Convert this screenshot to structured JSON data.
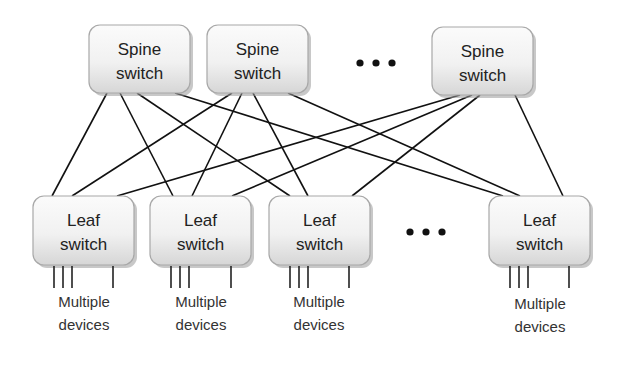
{
  "spines": [
    {
      "id": "spine-1",
      "line1": "Spine",
      "line2": "switch"
    },
    {
      "id": "spine-2",
      "line1": "Spine",
      "line2": "switch"
    },
    {
      "id": "spine-3",
      "line1": "Spine",
      "line2": "switch"
    }
  ],
  "leaves": [
    {
      "id": "leaf-1",
      "line1": "Leaf",
      "line2": "switch",
      "devices_line1": "Multiple",
      "devices_line2": "devices"
    },
    {
      "id": "leaf-2",
      "line1": "Leaf",
      "line2": "switch",
      "devices_line1": "Multiple",
      "devices_line2": "devices"
    },
    {
      "id": "leaf-3",
      "line1": "Leaf",
      "line2": "switch",
      "devices_line1": "Multiple",
      "devices_line2": "devices"
    },
    {
      "id": "leaf-4",
      "line1": "Leaf",
      "line2": "switch",
      "devices_line1": "Multiple",
      "devices_line2": "devices"
    }
  ],
  "ellipsis": {
    "spine_row": "more spine switches",
    "leaf_row": "more leaf switches"
  },
  "connections": [
    [
      "spine-1",
      "leaf-1"
    ],
    [
      "spine-1",
      "leaf-2"
    ],
    [
      "spine-1",
      "leaf-3"
    ],
    [
      "spine-1",
      "leaf-4"
    ],
    [
      "spine-2",
      "leaf-1"
    ],
    [
      "spine-2",
      "leaf-2"
    ],
    [
      "spine-2",
      "leaf-3"
    ],
    [
      "spine-2",
      "leaf-4"
    ],
    [
      "spine-3",
      "leaf-1"
    ],
    [
      "spine-3",
      "leaf-2"
    ],
    [
      "spine-3",
      "leaf-3"
    ],
    [
      "spine-3",
      "leaf-4"
    ]
  ],
  "devices_per_leaf_shown": 4
}
